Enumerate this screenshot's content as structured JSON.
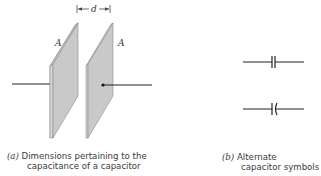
{
  "figure": {
    "panel_a": {
      "label": "(a)",
      "caption_line1": "Dimensions pertaining to the",
      "caption_line2": "capacitance of a capacitor",
      "plate_area_label_left": "A",
      "plate_area_label_right": "A",
      "separation_label": "d"
    },
    "panel_b": {
      "label": "(b)",
      "caption_line1": "Alternate",
      "caption_line2": "capacitor symbols",
      "symbols": [
        "parallel-plate-capacitor-symbol",
        "curved-plate-capacitor-symbol"
      ]
    },
    "colors": {
      "plate_face": "#c9c9c9",
      "plate_edge": "#8a8a8a",
      "wire": "#222222",
      "text": "#3a3a3a"
    }
  }
}
